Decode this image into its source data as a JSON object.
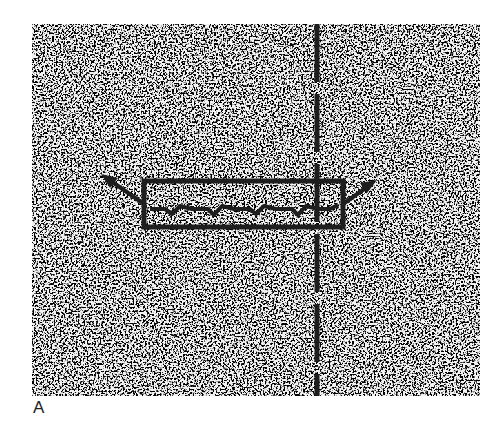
{
  "figure": {
    "panel_label": "A",
    "background": "#ffffff",
    "texture": {
      "name": "stippled-tissue-field",
      "x": 32,
      "y": 24,
      "width": 448,
      "height": 372,
      "dark_color": "#2a2a2a",
      "light_color": "#f4f4f4"
    },
    "dashed_line": {
      "x": 317,
      "y1": 24,
      "y2": 396,
      "color": "#1e1e1e"
    },
    "rectangle": {
      "x": 144,
      "y": 181,
      "width": 199,
      "height": 46,
      "color": "#1e1e1e"
    },
    "zigzag_midline_y": 209,
    "arrows": {
      "left": {
        "from": [
          144,
          204
        ],
        "to": [
          105,
          177
        ]
      },
      "right": {
        "from": [
          343,
          204
        ],
        "to": [
          374,
          182
        ]
      }
    }
  }
}
